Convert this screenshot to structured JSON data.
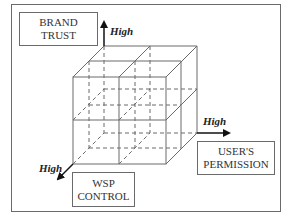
{
  "diagram": {
    "type": "3d-cube-matrix",
    "axes": {
      "vertical": {
        "label_lines": [
          "BRAND",
          "TRUST"
        ],
        "direction_label": "High"
      },
      "horizontal": {
        "label_lines": [
          "USER'S",
          "PERMISSION"
        ],
        "direction_label": "High"
      },
      "depth": {
        "label_lines": [
          "WSP",
          "CONTROL"
        ],
        "direction_label": "High"
      }
    },
    "cube_divisions": "2x2x2",
    "colors": {
      "line": "#6a6a6a",
      "arrow": "#111111",
      "text": "#333333"
    }
  }
}
